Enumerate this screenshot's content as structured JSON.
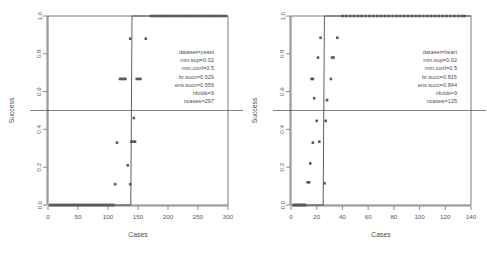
{
  "figure": {
    "background": "#ffffff",
    "point_color": "#5a5a5a",
    "line_color": "#4a4a4a",
    "axis_color": "#6e6e6e",
    "panel_count": 2
  },
  "chart_data": [
    {
      "type": "scatter",
      "panel": "left",
      "title": "",
      "xlabel": "Cases",
      "ylabel": "Success",
      "xlim": [
        0,
        300
      ],
      "ylim": [
        0.0,
        1.0
      ],
      "xticks": [
        0,
        50,
        100,
        150,
        200,
        250,
        300
      ],
      "xtick_labels": [
        "0",
        "50",
        "100",
        "150",
        "200",
        "250",
        "300"
      ],
      "yticks": [
        0.0,
        0.2,
        0.4,
        0.6,
        0.8,
        1.0
      ],
      "ytick_labels": [
        "0.0",
        "0.2",
        "0.4",
        "0.6",
        "0.8",
        "1.0"
      ],
      "grid": false,
      "legend": "none",
      "reference_line": {
        "orientation": "horizontal",
        "y": 0.5
      },
      "step_line": {
        "description": "step function from 0 at low case counts rising to 1 near x=140",
        "points": [
          [
            3,
            0.0
          ],
          [
            138,
            0.0
          ],
          [
            140,
            1.0
          ],
          [
            300,
            1.0
          ]
        ]
      },
      "annotation_position": "upper-right-inside",
      "annotations": [
        "dataset=yeast",
        "min.sup=0.02",
        "min.conf=0.5",
        "br.succ=0.529",
        "ens.succ=0.556",
        "nfolds=9",
        "ncases=297"
      ],
      "points": [
        [
          4,
          0.0
        ],
        [
          7,
          0.0
        ],
        [
          10,
          0.0
        ],
        [
          13,
          0.0
        ],
        [
          16,
          0.0
        ],
        [
          19,
          0.0
        ],
        [
          22,
          0.0
        ],
        [
          25,
          0.0
        ],
        [
          28,
          0.0
        ],
        [
          31,
          0.0
        ],
        [
          34,
          0.0
        ],
        [
          37,
          0.0
        ],
        [
          40,
          0.0
        ],
        [
          43,
          0.0
        ],
        [
          46,
          0.0
        ],
        [
          49,
          0.0
        ],
        [
          52,
          0.0
        ],
        [
          55,
          0.0
        ],
        [
          58,
          0.0
        ],
        [
          61,
          0.0
        ],
        [
          64,
          0.0
        ],
        [
          67,
          0.0
        ],
        [
          70,
          0.0
        ],
        [
          73,
          0.0
        ],
        [
          76,
          0.0
        ],
        [
          79,
          0.0
        ],
        [
          82,
          0.0
        ],
        [
          85,
          0.0
        ],
        [
          88,
          0.0
        ],
        [
          91,
          0.0
        ],
        [
          94,
          0.0
        ],
        [
          97,
          0.0
        ],
        [
          100,
          0.0
        ],
        [
          103,
          0.0
        ],
        [
          106,
          0.0
        ],
        [
          109,
          0.0
        ],
        [
          112,
          0.11
        ],
        [
          137,
          0.11
        ],
        [
          115,
          0.33
        ],
        [
          139,
          0.335
        ],
        [
          142,
          0.335
        ],
        [
          145,
          0.335
        ],
        [
          133,
          0.21
        ],
        [
          120,
          0.667
        ],
        [
          123,
          0.667
        ],
        [
          126,
          0.667
        ],
        [
          129,
          0.667
        ],
        [
          148,
          0.667
        ],
        [
          151,
          0.667
        ],
        [
          154,
          0.667
        ],
        [
          143,
          0.46
        ],
        [
          137,
          0.88
        ],
        [
          163,
          0.88
        ],
        [
          172,
          1.0
        ],
        [
          176,
          1.0
        ],
        [
          180,
          1.0
        ],
        [
          184,
          1.0
        ],
        [
          188,
          1.0
        ],
        [
          192,
          1.0
        ],
        [
          196,
          1.0
        ],
        [
          200,
          1.0
        ],
        [
          204,
          1.0
        ],
        [
          208,
          1.0
        ],
        [
          212,
          1.0
        ],
        [
          216,
          1.0
        ],
        [
          220,
          1.0
        ],
        [
          224,
          1.0
        ],
        [
          228,
          1.0
        ],
        [
          232,
          1.0
        ],
        [
          236,
          1.0
        ],
        [
          240,
          1.0
        ],
        [
          244,
          1.0
        ],
        [
          248,
          1.0
        ],
        [
          252,
          1.0
        ],
        [
          256,
          1.0
        ],
        [
          260,
          1.0
        ],
        [
          264,
          1.0
        ],
        [
          268,
          1.0
        ],
        [
          272,
          1.0
        ],
        [
          276,
          1.0
        ],
        [
          280,
          1.0
        ],
        [
          284,
          1.0
        ],
        [
          288,
          1.0
        ],
        [
          292,
          1.0
        ],
        [
          296,
          1.0
        ]
      ]
    },
    {
      "type": "scatter",
      "panel": "right",
      "title": "",
      "xlabel": "Cases",
      "ylabel": "Success",
      "xlim": [
        0,
        140
      ],
      "ylim": [
        0.0,
        1.0
      ],
      "xticks": [
        0,
        20,
        40,
        60,
        80,
        100,
        120,
        140
      ],
      "xtick_labels": [
        "0",
        "20",
        "40",
        "60",
        "80",
        "100",
        "120",
        "140"
      ],
      "yticks": [
        0.0,
        0.2,
        0.4,
        0.6,
        0.8,
        1.0
      ],
      "ytick_labels": [
        "0.0",
        "0.2",
        "0.4",
        "0.6",
        "0.8",
        "1.0"
      ],
      "grid": false,
      "legend": "none",
      "reference_line": {
        "orientation": "horizontal",
        "y": 0.5
      },
      "step_line": {
        "description": "step function from 0 at low case counts rising to 1 near x=26",
        "points": [
          [
            2,
            0.0
          ],
          [
            25,
            0.0
          ],
          [
            26,
            1.0
          ],
          [
            140,
            1.0
          ]
        ]
      },
      "annotation_position": "upper-right-inside",
      "annotations": [
        "dataset=heart",
        "min.sup=0.02",
        "min.conf=0.5",
        "br.succ=0.815",
        "ens.succ=0.844",
        "nfolds=9",
        "ncases=135"
      ],
      "points": [
        [
          2,
          0.0
        ],
        [
          3,
          0.0
        ],
        [
          4,
          0.0
        ],
        [
          5,
          0.0
        ],
        [
          6,
          0.0
        ],
        [
          7,
          0.0
        ],
        [
          8,
          0.0
        ],
        [
          9,
          0.0
        ],
        [
          10,
          0.0
        ],
        [
          11,
          0.0
        ],
        [
          13,
          0.12
        ],
        [
          14,
          0.12
        ],
        [
          26,
          0.115
        ],
        [
          15,
          0.22
        ],
        [
          17,
          0.33
        ],
        [
          22,
          0.335
        ],
        [
          20,
          0.445
        ],
        [
          27,
          0.445
        ],
        [
          18,
          0.565
        ],
        [
          28,
          0.555
        ],
        [
          16,
          0.667
        ],
        [
          17,
          0.667
        ],
        [
          31,
          0.667
        ],
        [
          21,
          0.78
        ],
        [
          32,
          0.78
        ],
        [
          33,
          0.78
        ],
        [
          23,
          0.885
        ],
        [
          36,
          0.885
        ],
        [
          40,
          1.0
        ],
        [
          43,
          1.0
        ],
        [
          46,
          1.0
        ],
        [
          49,
          1.0
        ],
        [
          52,
          1.0
        ],
        [
          55,
          1.0
        ],
        [
          58,
          1.0
        ],
        [
          61,
          1.0
        ],
        [
          64,
          1.0
        ],
        [
          67,
          1.0
        ],
        [
          70,
          1.0
        ],
        [
          73,
          1.0
        ],
        [
          76,
          1.0
        ],
        [
          79,
          1.0
        ],
        [
          82,
          1.0
        ],
        [
          85,
          1.0
        ],
        [
          88,
          1.0
        ],
        [
          91,
          1.0
        ],
        [
          94,
          1.0
        ],
        [
          97,
          1.0
        ],
        [
          100,
          1.0
        ],
        [
          103,
          1.0
        ],
        [
          106,
          1.0
        ],
        [
          109,
          1.0
        ],
        [
          112,
          1.0
        ],
        [
          115,
          1.0
        ],
        [
          118,
          1.0
        ],
        [
          121,
          1.0
        ],
        [
          124,
          1.0
        ],
        [
          127,
          1.0
        ],
        [
          130,
          1.0
        ],
        [
          133,
          1.0
        ],
        [
          135,
          1.0
        ]
      ]
    }
  ]
}
